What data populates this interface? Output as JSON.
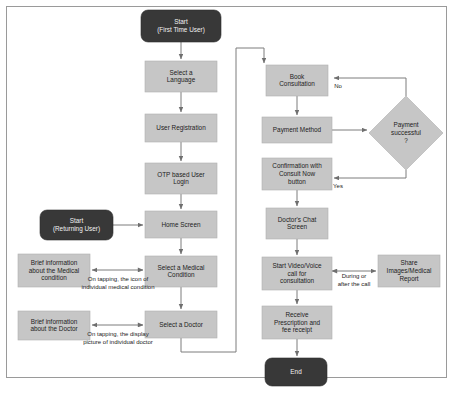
{
  "diagram": {
    "colors": {
      "process_fill": "#c6c6c6",
      "terminator_fill": "#383838",
      "decision_fill": "#c6c6c6",
      "connector": "#7d7d7d",
      "frame_border": "#9a9a9a",
      "background": "#ffffff"
    },
    "nodes": [
      {
        "id": "start1",
        "type": "terminator",
        "lines": [
          "Start",
          "(First Time User)"
        ],
        "x": 141,
        "y": 10,
        "w": 80,
        "h": 32,
        "r": 7
      },
      {
        "id": "lang",
        "type": "process",
        "lines": [
          "Select a",
          "Language"
        ],
        "x": 145,
        "y": 61,
        "w": 72,
        "h": 31
      },
      {
        "id": "reg",
        "type": "process",
        "lines": [
          "User Registration"
        ],
        "x": 145,
        "y": 114,
        "w": 72,
        "h": 28
      },
      {
        "id": "otp",
        "type": "process",
        "lines": [
          "OTP based User",
          "Login"
        ],
        "x": 145,
        "y": 163,
        "w": 72,
        "h": 31
      },
      {
        "id": "start2",
        "type": "terminator",
        "lines": [
          "Start",
          "(Returning User)"
        ],
        "x": 40,
        "y": 210,
        "w": 73,
        "h": 30,
        "r": 7
      },
      {
        "id": "home",
        "type": "process",
        "lines": [
          "Home Screen"
        ],
        "x": 145,
        "y": 211,
        "w": 72,
        "h": 27
      },
      {
        "id": "briefcond",
        "type": "process",
        "lines": [
          "Brief information",
          "about the Medical",
          "condition"
        ],
        "x": 18,
        "y": 254,
        "w": 72,
        "h": 33
      },
      {
        "id": "medcond",
        "type": "process",
        "lines": [
          "Select a Medical",
          "Condition"
        ],
        "x": 145,
        "y": 256,
        "w": 72,
        "h": 31
      },
      {
        "id": "briefdoc",
        "type": "process",
        "lines": [
          "Brief information",
          "about the Doctor"
        ],
        "x": 18,
        "y": 311,
        "w": 72,
        "h": 29
      },
      {
        "id": "seldoc",
        "type": "process",
        "lines": [
          "Select a Doctor"
        ],
        "x": 145,
        "y": 311,
        "w": 72,
        "h": 27
      },
      {
        "id": "book",
        "type": "process",
        "lines": [
          "Book",
          "Consultation"
        ],
        "x": 266,
        "y": 65,
        "w": 62,
        "h": 31
      },
      {
        "id": "pay",
        "type": "process",
        "lines": [
          "Payment Method"
        ],
        "x": 262,
        "y": 117,
        "w": 70,
        "h": 26
      },
      {
        "id": "paysucc",
        "type": "decision",
        "lines": [
          "Payment",
          "successful",
          "?"
        ],
        "cx": 406,
        "cy": 133,
        "hw": 37,
        "hh": 37
      },
      {
        "id": "confirm",
        "type": "process",
        "lines": [
          "Confirmation with",
          "Consult Now",
          "button"
        ],
        "x": 262,
        "y": 158,
        "w": 70,
        "h": 32
      },
      {
        "id": "chat",
        "type": "process",
        "lines": [
          "Doctor's Chat",
          "Screen"
        ],
        "x": 266,
        "y": 208,
        "w": 62,
        "h": 31
      },
      {
        "id": "call",
        "type": "process",
        "lines": [
          "Start Video/Voice",
          "call for",
          "consultation"
        ],
        "x": 262,
        "y": 257,
        "w": 70,
        "h": 33
      },
      {
        "id": "share",
        "type": "process",
        "lines": [
          "Share",
          "Images/Medical",
          "Report"
        ],
        "x": 378,
        "y": 255,
        "w": 62,
        "h": 32
      },
      {
        "id": "receipt",
        "type": "process",
        "lines": [
          "Receive",
          "Prescription and",
          "fee receipt"
        ],
        "x": 262,
        "y": 306,
        "w": 70,
        "h": 33
      },
      {
        "id": "end",
        "type": "terminator",
        "lines": [
          "End"
        ],
        "x": 265,
        "y": 358,
        "w": 62,
        "h": 28,
        "r": 7
      }
    ],
    "connectors": [
      {
        "id": "c-start1-lang",
        "d": "M181,42 L181,59",
        "arrow": "end"
      },
      {
        "id": "c-lang-reg",
        "d": "M181,92 L181,112",
        "arrow": "end"
      },
      {
        "id": "c-reg-otp",
        "d": "M181,142 L181,161",
        "arrow": "end"
      },
      {
        "id": "c-otp-home",
        "d": "M181,194 L181,209",
        "arrow": "end"
      },
      {
        "id": "c-start2-home",
        "d": "M113,225 L143,225",
        "arrow": "end"
      },
      {
        "id": "c-home-medcond",
        "d": "M181,238 L181,254",
        "arrow": "end"
      },
      {
        "id": "c-medcond-brief",
        "d": "M143,270 L92,270",
        "arrow": "both"
      },
      {
        "id": "c-medcond-seldoc",
        "d": "M181,287 L181,309",
        "arrow": "end"
      },
      {
        "id": "c-seldoc-brief",
        "d": "M143,325 L92,325",
        "arrow": "both"
      },
      {
        "id": "c-seldoc-book",
        "d": "M181,338 L181,352 L236,352 L236,48 L264,48 L264,63",
        "arrow": "end",
        "rounded": true
      },
      {
        "id": "c-book-pay",
        "d": "M297,96 L297,115",
        "arrow": "end"
      },
      {
        "id": "c-pay-dec",
        "d": "M332,130 L367,130",
        "arrow": "end"
      },
      {
        "id": "c-dec-no",
        "d": "M406,96 L406,78 L334,78",
        "arrow": "end"
      },
      {
        "id": "c-dec-yes",
        "d": "M406,170 L406,178 L334,178",
        "arrow": "end"
      },
      {
        "id": "c-confirm-chat",
        "d": "M297,190 L297,206",
        "arrow": "end"
      },
      {
        "id": "c-chat-call",
        "d": "M297,239 L297,255",
        "arrow": "end"
      },
      {
        "id": "c-call-share",
        "d": "M332,271 L376,271",
        "arrow": "both"
      },
      {
        "id": "c-call-receipt",
        "d": "M297,290 L297,304",
        "arrow": "end"
      },
      {
        "id": "c-receipt-end",
        "d": "M297,339 L297,356",
        "arrow": "end"
      }
    ],
    "edge_labels": [
      {
        "id": "lbl-no",
        "lines": [
          "No"
        ],
        "x": 338,
        "y": 86,
        "anchor": "start"
      },
      {
        "id": "lbl-yes",
        "lines": [
          "Yes"
        ],
        "x": 338,
        "y": 186,
        "anchor": "start"
      },
      {
        "id": "lbl-tap-cond",
        "lines": [
          "On tapping, the icon of",
          "individual medical condition"
        ],
        "x": 118,
        "y": 283,
        "anchor": "middle"
      },
      {
        "id": "lbl-tap-doc",
        "lines": [
          "On tapping, the display",
          "picture of individual doctor"
        ],
        "x": 118,
        "y": 338,
        "anchor": "middle"
      },
      {
        "id": "lbl-during",
        "lines": [
          "During or",
          "after the call"
        ],
        "x": 354,
        "y": 280,
        "anchor": "middle"
      }
    ]
  }
}
